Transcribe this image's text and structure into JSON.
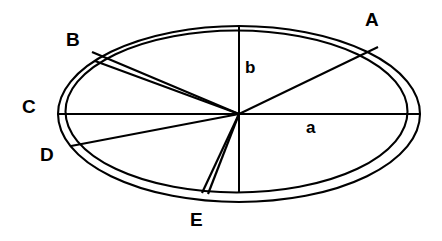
{
  "figure": {
    "background_color": "#ffffff",
    "stroke_color": "#000000"
  },
  "labels": {
    "sector_a": "A",
    "sector_b": "B",
    "sector_c": "C",
    "sector_d": "D",
    "sector_e": "E",
    "semi_major_axis": "a",
    "semi_minor_axis": "b"
  },
  "geometry": {
    "center": {
      "x": 239,
      "y": 114
    },
    "outer_ellipse": {
      "cx": 239,
      "cy": 114,
      "rx": 181,
      "ry": 88
    },
    "inner_ellipse": {
      "cx": 237,
      "cy": 112,
      "rx": 172,
      "ry": 82
    },
    "radial_lines": [
      {
        "name": "axis-a-right",
        "angle_deg": 0,
        "label": "a"
      },
      {
        "name": "radius-A",
        "angle_deg": 39,
        "label": "A"
      },
      {
        "name": "axis-b-up",
        "angle_deg": 90,
        "label": "b"
      },
      {
        "name": "wedge-B-upper",
        "angle_deg": 151,
        "label": "B"
      },
      {
        "name": "wedge-B-lower",
        "angle_deg": 155,
        "label": "B"
      },
      {
        "name": "axis-c-left",
        "angle_deg": 180,
        "label": "C"
      },
      {
        "name": "radius-D",
        "angle_deg": 198,
        "label": "D"
      },
      {
        "name": "wedge-E-left",
        "angle_deg": 256,
        "label": "E"
      },
      {
        "name": "wedge-E-right",
        "angle_deg": 259,
        "label": "E"
      },
      {
        "name": "axis-b-down",
        "angle_deg": 270,
        "label": "E"
      }
    ]
  },
  "label_positions": {
    "A": {
      "x": 365,
      "y": 10
    },
    "B": {
      "x": 66,
      "y": 30
    },
    "C": {
      "x": 22,
      "y": 97
    },
    "D": {
      "x": 40,
      "y": 145
    },
    "E": {
      "x": 190,
      "y": 210
    },
    "a": {
      "x": 306,
      "y": 119
    },
    "b": {
      "x": 245,
      "y": 59
    }
  }
}
